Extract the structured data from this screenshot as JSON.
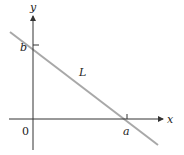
{
  "diagram": {
    "type": "line-intercepts",
    "axes": {
      "x_label": "x",
      "y_label": "y",
      "origin_label": "0"
    },
    "line": {
      "label": "L",
      "color": "#a8a8a8"
    },
    "intercepts": {
      "x_intercept_label": "a",
      "y_intercept_label": "b"
    },
    "colors": {
      "axis": "#333333",
      "line": "#a8a8a8",
      "text": "#222222"
    }
  }
}
